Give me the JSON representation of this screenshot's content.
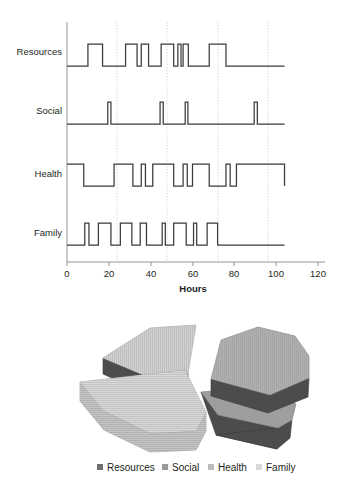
{
  "chart_data": [
    {
      "type": "line",
      "subtype": "step-state-timeline",
      "title": "",
      "xlabel": "Hours",
      "ylabel": "",
      "xlim": [
        0,
        120
      ],
      "xticks": [
        0,
        20,
        40,
        60,
        80,
        100,
        120
      ],
      "xticklabels": [
        "0",
        "20",
        "40",
        "60",
        "80",
        "100",
        "120"
      ],
      "gridlines_x": [
        24,
        48,
        72,
        96
      ],
      "grid": "vertical-dotted",
      "legend": "none",
      "categories": [
        "Resources",
        "Social",
        "Health",
        "Family"
      ],
      "series": [
        {
          "name": "Resources",
          "start_level": 0,
          "intervals_on": [
            [
              10,
              17
            ],
            [
              28,
              33.5
            ],
            [
              35.5,
              39
            ],
            [
              45,
              51
            ],
            [
              53,
              54.5
            ],
            [
              55.5,
              58
            ],
            [
              68,
              76
            ]
          ],
          "data_end": 104
        },
        {
          "name": "Social",
          "start_level": 0,
          "intervals_on": [
            [
              19.5,
              21
            ],
            [
              44.5,
              46
            ],
            [
              56.5,
              57.8
            ],
            [
              89.5,
              91
            ]
          ],
          "data_end": 104
        },
        {
          "name": "Health",
          "start_level": 1,
          "intervals_on": [
            [
              0,
              8
            ],
            [
              22.5,
              31.5
            ],
            [
              35.5,
              37.5
            ],
            [
              41,
              51
            ],
            [
              55.5,
              57.5
            ],
            [
              60,
              68
            ],
            [
              76,
              78
            ],
            [
              81,
              104
            ]
          ],
          "data_end": 104
        },
        {
          "name": "Family",
          "start_level": 0,
          "intervals_on": [
            [
              8.5,
              10.5
            ],
            [
              15,
              21
            ],
            [
              25.5,
              31
            ],
            [
              35,
              38
            ],
            [
              45.5,
              47
            ],
            [
              51,
              57
            ],
            [
              60.5,
              62
            ],
            [
              67,
              72
            ]
          ],
          "data_end": 104
        }
      ]
    },
    {
      "type": "pie",
      "title": "",
      "style": "3d-exploded",
      "labels": [
        "Resources",
        "Social",
        "Health",
        "Family"
      ],
      "values": [
        30,
        8,
        34,
        28
      ],
      "colors": [
        "#6f6f6f",
        "#9a9a9a",
        "#bcbcbc",
        "#d8d8d8"
      ],
      "legend_position": "bottom"
    }
  ],
  "legend": {
    "items": [
      {
        "label": "Resources",
        "color": "#6f6f6f"
      },
      {
        "label": "Social",
        "color": "#9a9a9a"
      },
      {
        "label": "Health",
        "color": "#bcbcbc"
      },
      {
        "label": "Family",
        "color": "#d8d8d8"
      }
    ]
  },
  "axis": {
    "title": "Hours"
  }
}
